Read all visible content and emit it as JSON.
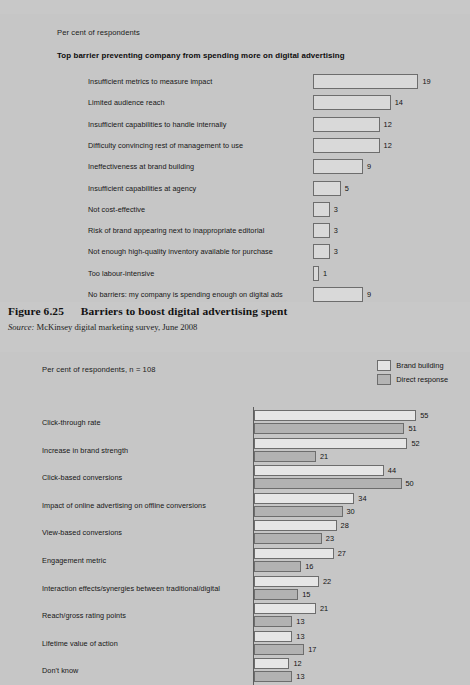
{
  "page": {
    "background": "#c8c8c8"
  },
  "figure": {
    "caption_label": "Figure 6.25",
    "caption_text": "Barriers to boost digital advertising spent",
    "source_label": "Source:",
    "source_text": " McKinsey digital marketing survey, June 2008"
  },
  "chart_top": {
    "subtitle": "Per cent of respondents",
    "title": "Top barrier preventing company from spending more on digital advertising"
  },
  "chart_bottom": {
    "subtitle": "Per cent of respondents, n = 108",
    "legend": [
      {
        "label": "Brand building",
        "color": "#e4e4e4"
      },
      {
        "label": "Direct response",
        "color": "#b4b4b4"
      }
    ]
  },
  "chart_data": [
    {
      "type": "bar",
      "orientation": "horizontal",
      "title": "Top barrier preventing company from spending more on digital advertising",
      "subtitle": "Per cent of respondents",
      "xlabel": "Per cent of respondents",
      "ylabel": "",
      "xlim": [
        0,
        20
      ],
      "grid": false,
      "legend": "none",
      "data_labels": true,
      "categories": [
        "Insufficient metrics to measure impact",
        "Limited audience reach",
        "Insufficient capabilities to handle internally",
        "Difficulty convincing rest of management to use",
        "Ineffectiveness at brand building",
        "Insufficient capabilities at agency",
        "Not cost-effective",
        "Risk of brand appearing next to inappropriate editorial",
        "Not enough high-quality inventory available for purchase",
        "Too labour-intensive",
        "No barriers: my company is spending enough on digital ads"
      ],
      "values": [
        19,
        14,
        12,
        12,
        9,
        5,
        3,
        3,
        3,
        1,
        9
      ]
    },
    {
      "type": "bar",
      "orientation": "horizontal",
      "title": "",
      "subtitle": "Per cent of respondents, n = 108",
      "xlabel": "Per cent of respondents",
      "ylabel": "",
      "xlim": [
        0,
        55
      ],
      "grid": false,
      "legend": "top-right",
      "data_labels": true,
      "categories": [
        "Click-through rate",
        "Increase in brand strength",
        "Click-based conversions",
        "Impact of online advertising on offline conversions",
        "View-based conversions",
        "Engagement metric",
        "Interaction effects/synergies between traditional/digital",
        "Reach/gross rating points",
        "Lifetime value of action",
        "Don't know"
      ],
      "series": [
        {
          "name": "Brand building",
          "color": "#e6e6e6",
          "values": [
            55,
            52,
            44,
            34,
            28,
            27,
            22,
            21,
            13,
            12
          ]
        },
        {
          "name": "Direct response",
          "color": "#b2b2b2",
          "values": [
            51,
            21,
            50,
            30,
            23,
            16,
            15,
            13,
            17,
            13
          ]
        }
      ]
    }
  ]
}
